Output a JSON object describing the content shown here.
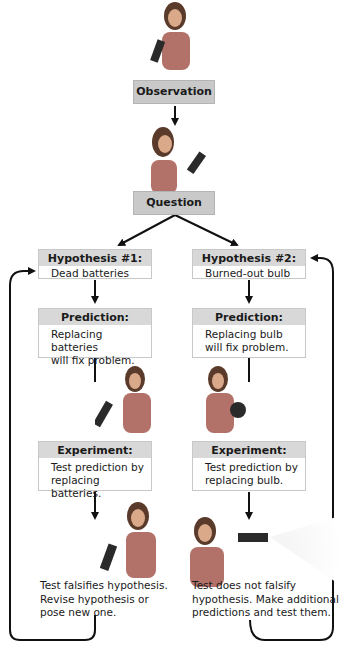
{
  "diagram": {
    "observation": "Observation",
    "question": "Question",
    "left": {
      "hypothesis_title": "Hypothesis #1:",
      "hypothesis_text": "Dead batteries",
      "prediction_title": "Prediction:",
      "prediction_line1": "Replacing batteries",
      "prediction_line2": "will fix problem.",
      "experiment_title": "Experiment:",
      "experiment_line1": "Test prediction by",
      "experiment_line2": "replacing batteries.",
      "result_line1": "Test falsifies hypothesis.",
      "result_line2": "Revise hypothesis or",
      "result_line3": "pose new one."
    },
    "right": {
      "hypothesis_title": "Hypothesis #2:",
      "hypothesis_text": "Burned-out bulb",
      "prediction_title": "Prediction:",
      "prediction_line1": "Replacing bulb",
      "prediction_line2": "will fix problem.",
      "experiment_title": "Experiment:",
      "experiment_line1": "Test prediction by",
      "experiment_line2": "replacing bulb.",
      "result_line1": "Test does not falsify",
      "result_line2": "hypothesis.  Make additional",
      "result_line3": "predictions and test them."
    },
    "colors": {
      "box_fill": "#c9c9c9",
      "header_fill": "#d8d8d8",
      "arrow": "#111111"
    }
  }
}
